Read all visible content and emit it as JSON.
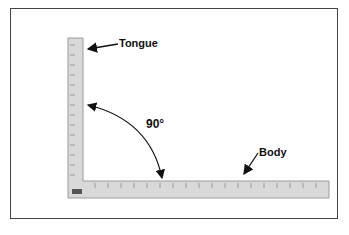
{
  "figure": {
    "labels": {
      "tongue": "Tongue",
      "body": "Body",
      "angle": "90°"
    },
    "colors": {
      "ruler_fill": "#d9d9d9",
      "ruler_edge": "#9a9a9a",
      "ink": "#111111",
      "frame": "#444444"
    }
  }
}
